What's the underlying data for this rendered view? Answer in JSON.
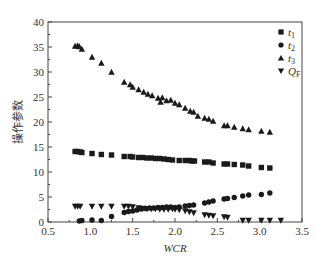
{
  "chart_data": {
    "type": "scatter",
    "title": "",
    "xlabel": "WCR",
    "ylabel": "操作参数",
    "xlim": [
      0.5,
      3.5
    ],
    "ylim": [
      0,
      40
    ],
    "xticks": [
      0.5,
      1.0,
      1.5,
      2.0,
      2.5,
      3.0,
      3.5
    ],
    "yticks": [
      0,
      5,
      10,
      15,
      20,
      25,
      30,
      35,
      40
    ],
    "grid": false,
    "legend_position": "upper right (inside)",
    "series": [
      {
        "name": "t1",
        "display": "t",
        "sub": "1",
        "marker": "square",
        "points": [
          [
            0.82,
            14.1
          ],
          [
            0.85,
            14.1
          ],
          [
            0.88,
            14.0
          ],
          [
            0.9,
            13.9
          ],
          [
            1.02,
            13.7
          ],
          [
            1.13,
            13.5
          ],
          [
            1.25,
            13.4
          ],
          [
            1.4,
            13.1
          ],
          [
            1.47,
            13.1
          ],
          [
            1.5,
            13.0
          ],
          [
            1.57,
            12.9
          ],
          [
            1.62,
            12.9
          ],
          [
            1.67,
            12.8
          ],
          [
            1.72,
            12.8
          ],
          [
            1.77,
            12.7
          ],
          [
            1.82,
            12.7
          ],
          [
            1.87,
            12.6
          ],
          [
            1.92,
            12.5
          ],
          [
            1.97,
            12.4
          ],
          [
            2.05,
            12.3
          ],
          [
            2.12,
            12.3
          ],
          [
            2.17,
            12.3
          ],
          [
            2.2,
            12.2
          ],
          [
            2.23,
            12.2
          ],
          [
            2.35,
            12.0
          ],
          [
            2.4,
            12.0
          ],
          [
            2.45,
            11.8
          ],
          [
            2.58,
            11.6
          ],
          [
            2.62,
            11.6
          ],
          [
            2.7,
            11.5
          ],
          [
            2.8,
            11.4
          ],
          [
            2.87,
            11.2
          ],
          [
            3.02,
            10.9
          ],
          [
            3.12,
            10.8
          ]
        ]
      },
      {
        "name": "t2",
        "display": "t",
        "sub": "2",
        "marker": "circle",
        "points": [
          [
            0.87,
            0.2
          ],
          [
            0.9,
            0.3
          ],
          [
            1.02,
            0.4
          ],
          [
            1.13,
            0.3
          ],
          [
            1.25,
            1.1
          ],
          [
            1.4,
            1.9
          ],
          [
            1.45,
            2.1
          ],
          [
            1.5,
            2.2
          ],
          [
            1.55,
            2.4
          ],
          [
            1.6,
            2.6
          ],
          [
            1.65,
            2.7
          ],
          [
            1.7,
            2.8
          ],
          [
            1.75,
            2.8
          ],
          [
            1.8,
            2.9
          ],
          [
            1.85,
            2.9
          ],
          [
            1.9,
            3.0
          ],
          [
            1.95,
            3.0
          ],
          [
            2.0,
            2.9
          ],
          [
            2.05,
            3.0
          ],
          [
            2.12,
            3.2
          ],
          [
            2.17,
            3.3
          ],
          [
            2.22,
            3.4
          ],
          [
            2.35,
            3.8
          ],
          [
            2.4,
            4.0
          ],
          [
            2.45,
            4.2
          ],
          [
            2.58,
            4.6
          ],
          [
            2.62,
            4.7
          ],
          [
            2.7,
            4.9
          ],
          [
            2.8,
            5.2
          ],
          [
            2.87,
            5.4
          ],
          [
            3.02,
            5.5
          ],
          [
            3.12,
            5.8
          ]
        ]
      },
      {
        "name": "t3",
        "display": "t",
        "sub": "3",
        "marker": "triangle-up",
        "points": [
          [
            0.82,
            35.2
          ],
          [
            0.85,
            35.3
          ],
          [
            0.87,
            35.1
          ],
          [
            0.9,
            34.6
          ],
          [
            1.02,
            33.0
          ],
          [
            1.13,
            31.8
          ],
          [
            1.25,
            30.0
          ],
          [
            1.4,
            28.0
          ],
          [
            1.47,
            27.5
          ],
          [
            1.5,
            27.0
          ],
          [
            1.57,
            26.5
          ],
          [
            1.63,
            26.0
          ],
          [
            1.68,
            25.6
          ],
          [
            1.73,
            25.3
          ],
          [
            1.8,
            24.8
          ],
          [
            1.83,
            24.0
          ],
          [
            1.85,
            24.9
          ],
          [
            1.9,
            24.3
          ],
          [
            1.95,
            24.4
          ],
          [
            2.0,
            23.8
          ],
          [
            2.05,
            23.5
          ],
          [
            2.12,
            22.8
          ],
          [
            2.18,
            22.2
          ],
          [
            2.22,
            22.0
          ],
          [
            2.27,
            21.2
          ],
          [
            2.35,
            20.8
          ],
          [
            2.4,
            20.6
          ],
          [
            2.45,
            20.2
          ],
          [
            2.58,
            19.3
          ],
          [
            2.62,
            19.3
          ],
          [
            2.7,
            19.0
          ],
          [
            2.8,
            18.7
          ],
          [
            2.87,
            18.5
          ],
          [
            3.02,
            18.2
          ],
          [
            3.12,
            18.0
          ]
        ]
      },
      {
        "name": "QF",
        "display": "Q",
        "sub": "F",
        "marker": "triangle-down",
        "points": [
          [
            0.82,
            3.1
          ],
          [
            0.85,
            3.1
          ],
          [
            0.88,
            3.1
          ],
          [
            1.02,
            3.1
          ],
          [
            1.13,
            3.1
          ],
          [
            1.25,
            3.1
          ],
          [
            1.4,
            3.1
          ],
          [
            1.45,
            3.1
          ],
          [
            1.5,
            3.0
          ],
          [
            1.57,
            2.8
          ],
          [
            1.62,
            2.7
          ],
          [
            1.67,
            2.6
          ],
          [
            1.72,
            2.6
          ],
          [
            1.77,
            2.6
          ],
          [
            1.82,
            2.5
          ],
          [
            1.87,
            2.5
          ],
          [
            1.92,
            2.5
          ],
          [
            1.97,
            2.6
          ],
          [
            2.0,
            2.5
          ],
          [
            2.05,
            2.4
          ],
          [
            2.12,
            2.2
          ],
          [
            2.17,
            2.0
          ],
          [
            2.22,
            1.8
          ],
          [
            2.35,
            1.4
          ],
          [
            2.4,
            1.3
          ],
          [
            2.45,
            1.2
          ],
          [
            2.58,
            1.0
          ],
          [
            2.62,
            0.9
          ],
          [
            2.8,
            0.3
          ],
          [
            2.87,
            0.3
          ],
          [
            3.02,
            0.3
          ],
          [
            3.12,
            0.3
          ],
          [
            3.25,
            0.3
          ]
        ]
      }
    ]
  },
  "colors": {
    "marker": "#1a1a1a",
    "axis": "#444444",
    "text": "#333333"
  }
}
